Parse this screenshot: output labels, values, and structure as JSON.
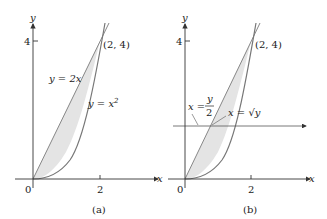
{
  "panel_a": {
    "caption": "(a)",
    "x_axis_label": "x",
    "y_axis_label": "y",
    "origin_label": "0",
    "x_tick": "2",
    "y_tick": "4",
    "point_label": "(2, 4)",
    "line_label": "y = 2x",
    "curve_label_base": "y = x",
    "curve_label_exp": "2"
  },
  "panel_b": {
    "caption": "(b)",
    "x_axis_label": "x",
    "y_axis_label": "y",
    "origin_label": "0",
    "x_tick": "2",
    "y_tick": "4",
    "point_label": "(2, 4)",
    "line_label_left": "x =",
    "line_label_num": "y",
    "line_label_den": "2",
    "curve_label": "x = √y"
  },
  "colors": {
    "region_fill": "#e6e6e6",
    "curve_stroke": "#777777",
    "axis": "#333333"
  }
}
